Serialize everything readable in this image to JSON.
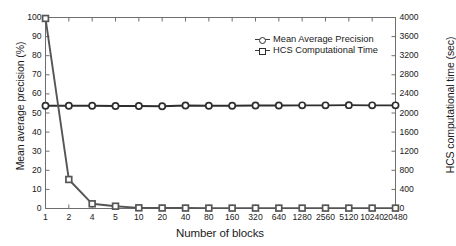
{
  "chart_data": {
    "type": "line",
    "title": "",
    "xlabel": "Number of blocks",
    "categories": [
      "1",
      "2",
      "4",
      "5",
      "10",
      "20",
      "40",
      "80",
      "160",
      "320",
      "640",
      "1280",
      "2560",
      "5120",
      "10240",
      "20480"
    ],
    "grid": false,
    "legend_position": "upper-right-inside",
    "axes": {
      "left": {
        "label": "Mean average precision (%)",
        "ticks": [
          "0",
          "10",
          "20",
          "30",
          "40",
          "50",
          "60",
          "70",
          "80",
          "90",
          "100"
        ],
        "min": 0,
        "max": 100
      },
      "right": {
        "label": "HCS computational time (sec)",
        "ticks": [
          "0",
          "400",
          "800",
          "1200",
          "1600",
          "2000",
          "2400",
          "2800",
          "3200",
          "3600",
          "4000"
        ],
        "min": 0,
        "max": 4000
      }
    },
    "series": [
      {
        "name": "Mean Average Precision",
        "axis": "left",
        "marker": "circle",
        "color": "#2e2e2e",
        "unit": "%",
        "values": [
          53.8,
          53.8,
          53.8,
          53.7,
          53.7,
          53.5,
          53.9,
          53.8,
          53.8,
          53.9,
          53.9,
          54.0,
          54.0,
          54.1,
          54.0,
          54.0
        ]
      },
      {
        "name": "HCS Computational Time",
        "axis": "right",
        "marker": "square",
        "color": "#555555",
        "unit": "sec",
        "values": [
          3980,
          608,
          98,
          48,
          14,
          10,
          9,
          8,
          8,
          8,
          8,
          8,
          8,
          8,
          8,
          8
        ]
      }
    ]
  },
  "legend": {
    "entries": [
      {
        "label": "Mean Average Precision"
      },
      {
        "label": "HCS Computational Time"
      }
    ]
  }
}
